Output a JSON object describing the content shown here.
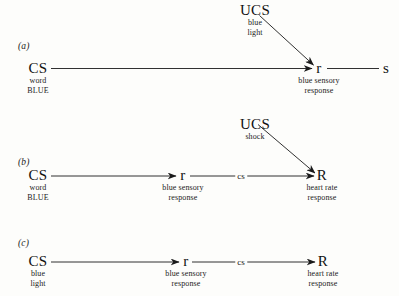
{
  "figure": {
    "background": "#fdfdfb",
    "ink": "#1a1a1a",
    "panels": [
      {
        "id": "a",
        "label": "(a)",
        "nodes": {
          "ucs": {
            "name": "UCS",
            "line1": "blue",
            "line2": "light"
          },
          "cs": {
            "name": "CS",
            "line1": "word",
            "line2": "BLUE"
          },
          "r": {
            "name": "r",
            "line1": "blue sensory",
            "line2": "response"
          },
          "s": {
            "name": "s",
            "line1": "",
            "line2": ""
          }
        }
      },
      {
        "id": "b",
        "label": "(b)",
        "nodes": {
          "ucs": {
            "name": "UCS",
            "line1": "shock",
            "line2": ""
          },
          "cs": {
            "name": "CS",
            "line1": "word",
            "line2": "BLUE"
          },
          "r": {
            "name": "r",
            "line1": "blue sensory",
            "line2": "response"
          },
          "bigr": {
            "name": "R",
            "line1": "heart rate",
            "line2": "response"
          }
        },
        "edge_label": "cs"
      },
      {
        "id": "c",
        "label": "(c)",
        "nodes": {
          "cs": {
            "name": "CS",
            "line1": "blue",
            "line2": "light"
          },
          "r": {
            "name": "r",
            "line1": "blue sensory",
            "line2": "response"
          },
          "bigr": {
            "name": "R",
            "line1": "heart rate",
            "line2": "response"
          }
        },
        "edge_label": "cs"
      }
    ]
  }
}
